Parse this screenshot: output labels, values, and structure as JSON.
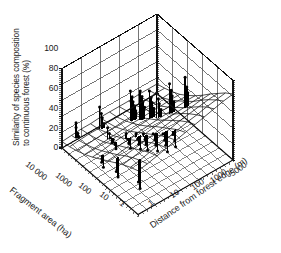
{
  "figure": {
    "background": "#ffffff",
    "ink": "#111111",
    "mesh_color": "#3a3a3a",
    "spike_color": "#000000"
  },
  "chart_data": {
    "type": "surface",
    "title": "",
    "projection": "3d",
    "grid": true,
    "legend": false,
    "zlabel_line1": "Similarity of species composition",
    "zlabel_line2": "to continuous forest (%)",
    "zticks": [
      "100",
      "80",
      "60",
      "40",
      "20",
      "0"
    ],
    "zlim": [
      0,
      100
    ],
    "xlabel": "Fragment area (ha)",
    "xticks": [
      "10 000",
      "1000",
      "100",
      "10",
      "1"
    ],
    "xlim_log": [
      10000,
      1
    ],
    "ylabel": "Distance from forest edge (m)",
    "yticks": [
      "1",
      "10",
      "100",
      "1000",
      "5000"
    ],
    "ylim_log": [
      1,
      5000
    ],
    "surface_note": "fitted response surface, fine wireframe mesh, rises toward large fragment area and large distance from edge",
    "surface_z_grid": [
      [
        8,
        10,
        13,
        17,
        22,
        28,
        34,
        40,
        46,
        51,
        55
      ],
      [
        9,
        11,
        14,
        18,
        23,
        29,
        35,
        42,
        48,
        53,
        57
      ],
      [
        10,
        12,
        15,
        19,
        25,
        31,
        37,
        44,
        50,
        56,
        60
      ],
      [
        10,
        12,
        16,
        20,
        26,
        32,
        39,
        46,
        53,
        59,
        63
      ],
      [
        11,
        13,
        16,
        21,
        27,
        34,
        41,
        48,
        55,
        61,
        66
      ],
      [
        11,
        13,
        17,
        22,
        28,
        35,
        43,
        50,
        57,
        64,
        69
      ],
      [
        11,
        14,
        17,
        22,
        29,
        36,
        44,
        52,
        60,
        67,
        72
      ],
      [
        11,
        14,
        18,
        23,
        30,
        37,
        45,
        54,
        62,
        69,
        75
      ],
      [
        12,
        14,
        18,
        23,
        30,
        38,
        46,
        55,
        64,
        72,
        78
      ],
      [
        12,
        15,
        18,
        24,
        31,
        39,
        47,
        57,
        66,
        74,
        81
      ],
      [
        12,
        15,
        19,
        24,
        31,
        39,
        48,
        58,
        67,
        76,
        83
      ]
    ],
    "observations_note": "each datum drawn as a vertical drop-line from the fitted surface to the observed value, capped with a filled circle marker",
    "observations": [
      {
        "gx": 0.06,
        "gy": 0.1,
        "value": 30
      },
      {
        "gx": 0.06,
        "gy": 0.1,
        "value": 24
      },
      {
        "gx": 0.07,
        "gy": 0.11,
        "value": 17
      },
      {
        "gx": 0.07,
        "gy": 0.12,
        "value": 12
      },
      {
        "gx": 0.12,
        "gy": 0.3,
        "value": 41
      },
      {
        "gx": 0.13,
        "gy": 0.31,
        "value": 33
      },
      {
        "gx": 0.13,
        "gy": 0.32,
        "value": 27
      },
      {
        "gx": 0.14,
        "gy": 0.33,
        "value": 20
      },
      {
        "gx": 0.25,
        "gy": 0.52,
        "value": 57
      },
      {
        "gx": 0.26,
        "gy": 0.53,
        "value": 50
      },
      {
        "gx": 0.26,
        "gy": 0.54,
        "value": 43
      },
      {
        "gx": 0.27,
        "gy": 0.55,
        "value": 37
      },
      {
        "gx": 0.27,
        "gy": 0.56,
        "value": 31
      },
      {
        "gx": 0.33,
        "gy": 0.56,
        "value": 61
      },
      {
        "gx": 0.34,
        "gy": 0.57,
        "value": 54
      },
      {
        "gx": 0.34,
        "gy": 0.58,
        "value": 47
      },
      {
        "gx": 0.35,
        "gy": 0.59,
        "value": 40
      },
      {
        "gx": 0.4,
        "gy": 0.6,
        "value": 64
      },
      {
        "gx": 0.41,
        "gy": 0.61,
        "value": 56
      },
      {
        "gx": 0.41,
        "gy": 0.62,
        "value": 49
      },
      {
        "gx": 0.42,
        "gy": 0.63,
        "value": 42
      },
      {
        "gx": 0.47,
        "gy": 0.62,
        "value": 66
      },
      {
        "gx": 0.48,
        "gy": 0.63,
        "value": 59
      },
      {
        "gx": 0.48,
        "gy": 0.64,
        "value": 52
      },
      {
        "gx": 0.49,
        "gy": 0.65,
        "value": 45
      },
      {
        "gx": 0.54,
        "gy": 0.7,
        "value": 78
      },
      {
        "gx": 0.55,
        "gy": 0.71,
        "value": 70
      },
      {
        "gx": 0.55,
        "gy": 0.72,
        "value": 62
      },
      {
        "gx": 0.56,
        "gy": 0.73,
        "value": 55
      },
      {
        "gx": 0.62,
        "gy": 0.8,
        "value": 86
      },
      {
        "gx": 0.63,
        "gy": 0.81,
        "value": 74
      },
      {
        "gx": 0.63,
        "gy": 0.82,
        "value": 66
      },
      {
        "gx": 0.3,
        "gy": 0.24,
        "value": 34
      },
      {
        "gx": 0.31,
        "gy": 0.25,
        "value": 27
      },
      {
        "gx": 0.31,
        "gy": 0.26,
        "value": 21
      },
      {
        "gx": 0.32,
        "gy": 0.27,
        "value": 15
      },
      {
        "gx": 0.4,
        "gy": 0.22,
        "value": 29
      },
      {
        "gx": 0.41,
        "gy": 0.23,
        "value": 23
      },
      {
        "gx": 0.41,
        "gy": 0.24,
        "value": 17
      },
      {
        "gx": 0.47,
        "gy": 0.3,
        "value": 37
      },
      {
        "gx": 0.48,
        "gy": 0.31,
        "value": 30
      },
      {
        "gx": 0.48,
        "gy": 0.32,
        "value": 24
      },
      {
        "gx": 0.49,
        "gy": 0.33,
        "value": 18
      },
      {
        "gx": 0.55,
        "gy": 0.34,
        "value": 41
      },
      {
        "gx": 0.56,
        "gy": 0.35,
        "value": 34
      },
      {
        "gx": 0.56,
        "gy": 0.36,
        "value": 27
      },
      {
        "gx": 0.57,
        "gy": 0.37,
        "value": 21
      },
      {
        "gx": 0.62,
        "gy": 0.36,
        "value": 45
      },
      {
        "gx": 0.63,
        "gy": 0.37,
        "value": 38
      },
      {
        "gx": 0.63,
        "gy": 0.38,
        "value": 31
      },
      {
        "gx": 0.64,
        "gy": 0.39,
        "value": 24
      },
      {
        "gx": 0.7,
        "gy": 0.4,
        "value": 49
      },
      {
        "gx": 0.71,
        "gy": 0.41,
        "value": 42
      },
      {
        "gx": 0.71,
        "gy": 0.42,
        "value": 34
      },
      {
        "gx": 0.72,
        "gy": 0.43,
        "value": 27
      },
      {
        "gx": 0.78,
        "gy": 0.44,
        "value": 53
      },
      {
        "gx": 0.79,
        "gy": 0.45,
        "value": 45
      },
      {
        "gx": 0.79,
        "gy": 0.46,
        "value": 38
      },
      {
        "gx": 0.8,
        "gy": 0.47,
        "value": 30
      },
      {
        "gx": 0.86,
        "gy": 0.48,
        "value": 56
      },
      {
        "gx": 0.87,
        "gy": 0.49,
        "value": 48
      },
      {
        "gx": 0.87,
        "gy": 0.5,
        "value": 40
      },
      {
        "gx": 0.46,
        "gy": 0.05,
        "value": 17
      },
      {
        "gx": 0.47,
        "gy": 0.06,
        "value": 11
      },
      {
        "gx": 0.64,
        "gy": 0.06,
        "value": 20
      },
      {
        "gx": 0.65,
        "gy": 0.07,
        "value": 13
      },
      {
        "gx": 0.88,
        "gy": 0.1,
        "value": 24
      },
      {
        "gx": 0.89,
        "gy": 0.11,
        "value": 16
      }
    ]
  }
}
